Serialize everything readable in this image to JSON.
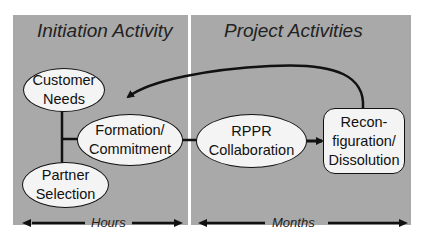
{
  "sections": {
    "initiation": {
      "title": "Initiation Activity",
      "timescale": "Hours"
    },
    "project": {
      "title": "Project Activities",
      "timescale": "Months"
    }
  },
  "nodes": {
    "customer_needs": {
      "line1": "Customer",
      "line2": "Needs",
      "shape": "ellipse"
    },
    "partner_selection": {
      "line1": "Partner",
      "line2": "Selection",
      "shape": "ellipse"
    },
    "formation": {
      "line1": "Formation/",
      "line2": "Commitment",
      "shape": "ellipse"
    },
    "rppr": {
      "line1": "RPPR",
      "line2": "Collaboration",
      "shape": "ellipse"
    },
    "reconfig": {
      "line1": "Recon-",
      "line2": "figuration/",
      "line3": "Dissolution",
      "shape": "rounded-rectangle"
    }
  },
  "edges": [
    {
      "from": "Customer Needs",
      "to": "Partner Selection",
      "type": "line"
    },
    {
      "from": "Customer/Partner junction",
      "to": "Formation/Commitment",
      "type": "line"
    },
    {
      "from": "Formation/Commitment",
      "to": "RPPR Collaboration",
      "type": "line"
    },
    {
      "from": "RPPR Collaboration",
      "to": "Reconfiguration/Dissolution",
      "type": "arrow"
    },
    {
      "from": "Reconfiguration/Dissolution",
      "to": "Customer Needs",
      "type": "curved-arrow"
    }
  ],
  "colors": {
    "panel": "#a9a9a9",
    "node_fill": "#f4f4f4",
    "stroke": "#111111"
  }
}
